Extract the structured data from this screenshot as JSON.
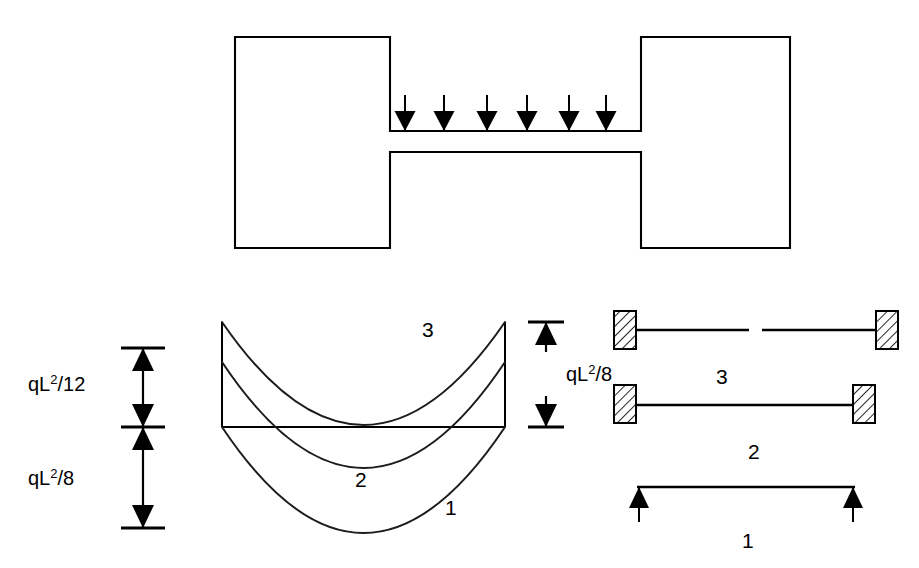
{
  "figure": {
    "background_color": "#ffffff",
    "line_color": "#000000"
  },
  "top_structure": {
    "name": "loaded-beam-elevation",
    "description": "Beam spanning between two large end blocks, carrying a uniformly distributed downward load",
    "left_block": {
      "x": 235,
      "y": 37,
      "width": 155,
      "height": 211
    },
    "right_block": {
      "x": 641,
      "y": 37,
      "width": 149,
      "height": 211
    },
    "beam": {
      "x1": 390,
      "x2": 641,
      "top_y": 131,
      "bottom_y": 152
    },
    "load": {
      "name": "distributed-load",
      "direction": "down",
      "arrow_count": 6,
      "arrow_x_positions": [
        405,
        444,
        487,
        527,
        569,
        606
      ],
      "arrow_tail_y": 95,
      "arrow_tip_y": 131
    }
  },
  "moment_diagram": {
    "name": "bending-moment-diagram",
    "baseline": {
      "x1": 222,
      "x2": 505,
      "y": 427
    },
    "left_edge": {
      "x": 222,
      "y_top": 322,
      "y_bottom": 427
    },
    "right_edge": {
      "x": 505,
      "y_top": 322,
      "y_bottom": 427
    },
    "curves": [
      {
        "label": "1",
        "case": "simply-supported",
        "start_y": 427,
        "end_y": 427,
        "mid_y": 533,
        "label_x": 445,
        "label_y": 515
      },
      {
        "label": "2",
        "case": "fixed-fixed",
        "start_y": 362,
        "end_y": 362,
        "mid_y": 468,
        "label_x": 355,
        "label_y": 487
      },
      {
        "label": "3",
        "case": "fixed-fixed-with-central-hinge",
        "start_y": 322,
        "end_y": 322,
        "mid_y": 425,
        "label_x": 422,
        "label_y": 337
      }
    ]
  },
  "left_dimensions": {
    "name": "moment-magnitude-dimensions",
    "axis_x": 143,
    "ticks_y": [
      348,
      427,
      528
    ],
    "tick_half_width": 22,
    "entries": [
      {
        "name": "dimension-ql2-over-12",
        "base": "qL",
        "exponent": "2",
        "denominator": "/12",
        "text": "qL2/12",
        "from_y": 348,
        "to_y": 427,
        "label_x": 28,
        "label_y": 391
      },
      {
        "name": "dimension-ql2-over-8",
        "base": "qL",
        "exponent": "2",
        "denominator": "/8",
        "text": "qL2/8",
        "from_y": 427,
        "to_y": 528,
        "label_x": 28,
        "label_y": 485
      }
    ]
  },
  "right_dimension": {
    "name": "midspan-moment-dimension",
    "axis_x": 546,
    "ticks_y": [
      322,
      427
    ],
    "tick_half_width": 18,
    "base": "qL",
    "exponent": "2",
    "denominator": "/8",
    "text": "qL2/8",
    "label_x": 566,
    "label_y": 381
  },
  "support_cases": {
    "name": "beam-support-cases-legend",
    "items": [
      {
        "label": "3",
        "name": "case-3-fixed-fixed-hinged",
        "support_type": "fixed-both-ends-with-central-hinge",
        "beam_y": 330,
        "beam_x1": 628,
        "beam_x2": 884,
        "has_central_gap": true,
        "gap_x1": 749,
        "gap_x2": 762,
        "left_support": {
          "x": 614,
          "y": 311,
          "width": 22,
          "height": 38
        },
        "right_support": {
          "x": 876,
          "y": 311,
          "width": 22,
          "height": 38
        },
        "label_x": 716,
        "label_y": 384
      },
      {
        "label": "2",
        "name": "case-2-fixed-fixed",
        "support_type": "fixed-both-ends",
        "beam_y": 405,
        "beam_x1": 634,
        "beam_x2": 855,
        "has_central_gap": false,
        "left_support": {
          "x": 614,
          "y": 385,
          "width": 22,
          "height": 38
        },
        "right_support": {
          "x": 853,
          "y": 385,
          "width": 22,
          "height": 38
        },
        "label_x": 748,
        "label_y": 459
      },
      {
        "label": "1",
        "name": "case-1-simply-supported",
        "support_type": "pinned-both-ends",
        "beam_y": 487,
        "beam_x1": 637,
        "beam_x2": 855,
        "has_central_gap": false,
        "reaction_arrows": [
          {
            "x": 639,
            "tail_y": 522,
            "tip_y": 487
          },
          {
            "x": 853,
            "tail_y": 522,
            "tip_y": 487
          }
        ],
        "label_x": 742,
        "label_y": 548
      }
    ]
  }
}
